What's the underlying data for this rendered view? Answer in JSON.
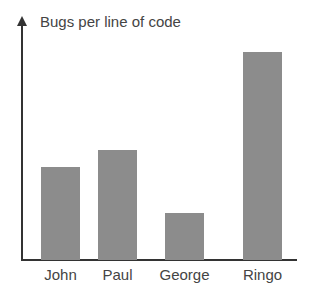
{
  "chart_data": {
    "type": "bar",
    "title": "Bugs per line of code",
    "xlabel": "",
    "ylabel": "Bugs per line of code",
    "categories": [
      "John",
      "Paul",
      "George",
      "Ringo"
    ],
    "values": [
      93,
      110,
      47,
      208
    ],
    "ylim": [
      0,
      235
    ],
    "grid": false,
    "legend": null,
    "bar_color": "#8c8c8c",
    "axis_color": "#333333"
  },
  "bars": [
    {
      "label": "John",
      "left": 41,
      "height": 93
    },
    {
      "label": "Paul",
      "left": 98,
      "height": 110
    },
    {
      "label": "George",
      "left": 165,
      "height": 47
    },
    {
      "label": "Ringo",
      "left": 243,
      "height": 208
    }
  ]
}
